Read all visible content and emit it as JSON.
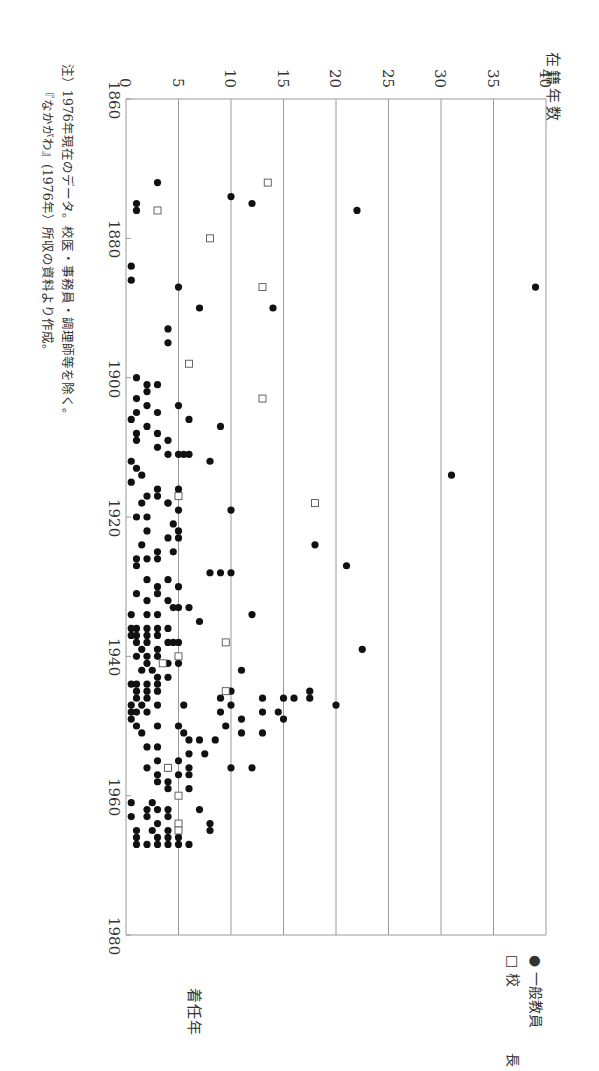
{
  "chart_data": {
    "type": "scatter",
    "orientation": "rotated-90-clockwise",
    "title": "",
    "xlabel": "着任年",
    "ylabel": "在籍年数",
    "xlim": [
      1860,
      1980
    ],
    "ylim": [
      0,
      40
    ],
    "x_ticks": [
      1860,
      1880,
      1900,
      1920,
      1940,
      1960,
      1980
    ],
    "y_ticks": [
      0,
      5,
      10,
      15,
      20,
      25,
      30,
      35,
      40
    ],
    "grid": "horizontal lines at each y tick",
    "legend": {
      "position": "lower-right (rotated)",
      "entries": [
        "一般教員",
        "校　長"
      ]
    },
    "series": [
      {
        "name": "一般教員",
        "marker": "filled-circle",
        "points": [
          [
            1872,
            3
          ],
          [
            1874,
            10
          ],
          [
            1875,
            1
          ],
          [
            1875,
            12
          ],
          [
            1876,
            1
          ],
          [
            1876,
            22
          ],
          [
            1884,
            0.5
          ],
          [
            1886,
            0.5
          ],
          [
            1887,
            39
          ],
          [
            1887,
            5
          ],
          [
            1890,
            7
          ],
          [
            1890,
            14
          ],
          [
            1893,
            4
          ],
          [
            1895,
            4
          ],
          [
            1900,
            1
          ],
          [
            1901,
            2
          ],
          [
            1901,
            3
          ],
          [
            1902,
            2
          ],
          [
            1903,
            1
          ],
          [
            1904,
            2
          ],
          [
            1904,
            5
          ],
          [
            1905,
            3
          ],
          [
            1905,
            1
          ],
          [
            1906,
            0.5
          ],
          [
            1906,
            6
          ],
          [
            1907,
            2
          ],
          [
            1907,
            9
          ],
          [
            1908,
            3
          ],
          [
            1908,
            1
          ],
          [
            1909,
            4
          ],
          [
            1909,
            1
          ],
          [
            1910,
            3
          ],
          [
            1911,
            5
          ],
          [
            1911,
            4
          ],
          [
            1911,
            6
          ],
          [
            1911,
            5.5
          ],
          [
            1912,
            0.5
          ],
          [
            1912,
            8
          ],
          [
            1913,
            1
          ],
          [
            1914,
            1.5
          ],
          [
            1914,
            31
          ],
          [
            1915,
            0.5
          ],
          [
            1916,
            3
          ],
          [
            1916,
            5
          ],
          [
            1917,
            2
          ],
          [
            1917,
            3
          ],
          [
            1918,
            4
          ],
          [
            1918,
            1.5
          ],
          [
            1918,
            4
          ],
          [
            1919,
            5
          ],
          [
            1919,
            10
          ],
          [
            1920,
            2
          ],
          [
            1920,
            1
          ],
          [
            1921,
            4.5
          ],
          [
            1922,
            2
          ],
          [
            1922,
            5
          ],
          [
            1923,
            4
          ],
          [
            1923,
            5
          ],
          [
            1924,
            1.5
          ],
          [
            1924,
            18
          ],
          [
            1925,
            3
          ],
          [
            1925,
            4.5
          ],
          [
            1926,
            2
          ],
          [
            1926,
            3
          ],
          [
            1926,
            1
          ],
          [
            1927,
            1
          ],
          [
            1927,
            21
          ],
          [
            1928,
            10
          ],
          [
            1928,
            9
          ],
          [
            1928,
            8
          ],
          [
            1929,
            2
          ],
          [
            1929,
            4
          ],
          [
            1930,
            3
          ],
          [
            1930,
            5
          ],
          [
            1931,
            1
          ],
          [
            1931,
            3
          ],
          [
            1932,
            2
          ],
          [
            1932,
            4
          ],
          [
            1933,
            4.5
          ],
          [
            1933,
            5
          ],
          [
            1933,
            6
          ],
          [
            1934,
            0.5
          ],
          [
            1934,
            2
          ],
          [
            1934,
            3
          ],
          [
            1934,
            12
          ],
          [
            1935,
            7
          ],
          [
            1936,
            0.5
          ],
          [
            1936,
            1
          ],
          [
            1936,
            2
          ],
          [
            1936,
            3
          ],
          [
            1936,
            4
          ],
          [
            1937,
            0.5
          ],
          [
            1937,
            1
          ],
          [
            1937,
            2
          ],
          [
            1937,
            3
          ],
          [
            1938,
            1
          ],
          [
            1938,
            2
          ],
          [
            1938,
            4
          ],
          [
            1938,
            4.5
          ],
          [
            1938,
            5
          ],
          [
            1939,
            1.5
          ],
          [
            1939,
            3
          ],
          [
            1939,
            22.5
          ],
          [
            1940,
            1
          ],
          [
            1940,
            2
          ],
          [
            1940,
            3
          ],
          [
            1941,
            2
          ],
          [
            1941,
            4
          ],
          [
            1941,
            5
          ],
          [
            1942,
            1.5
          ],
          [
            1942,
            2.5
          ],
          [
            1942,
            11
          ],
          [
            1943,
            3
          ],
          [
            1943,
            4
          ],
          [
            1944,
            0.5
          ],
          [
            1944,
            1
          ],
          [
            1944,
            2
          ],
          [
            1944,
            3
          ],
          [
            1945,
            1
          ],
          [
            1945,
            2
          ],
          [
            1945,
            3
          ],
          [
            1945,
            10
          ],
          [
            1945,
            17.5
          ],
          [
            1946,
            1
          ],
          [
            1946,
            2
          ],
          [
            1946,
            17.5
          ],
          [
            1946,
            9
          ],
          [
            1946,
            13
          ],
          [
            1946,
            15
          ],
          [
            1946,
            16
          ],
          [
            1947,
            0.5
          ],
          [
            1947,
            1.5
          ],
          [
            1947,
            3
          ],
          [
            1947,
            5.5
          ],
          [
            1947,
            10
          ],
          [
            1947,
            20
          ],
          [
            1948,
            0.5
          ],
          [
            1948,
            1
          ],
          [
            1948,
            2
          ],
          [
            1948,
            9
          ],
          [
            1948,
            13
          ],
          [
            1948,
            14.5
          ],
          [
            1949,
            0.5
          ],
          [
            1949,
            11
          ],
          [
            1949,
            15
          ],
          [
            1950,
            1
          ],
          [
            1950,
            3
          ],
          [
            1950,
            5
          ],
          [
            1950,
            9.5
          ],
          [
            1951,
            1.5
          ],
          [
            1951,
            5.5
          ],
          [
            1951,
            11
          ],
          [
            1951,
            13
          ],
          [
            1952,
            6
          ],
          [
            1952,
            7
          ],
          [
            1952,
            8.5
          ],
          [
            1953,
            2
          ],
          [
            1953,
            3
          ],
          [
            1954,
            6
          ],
          [
            1954,
            7.5
          ],
          [
            1955,
            3
          ],
          [
            1955,
            5
          ],
          [
            1956,
            2
          ],
          [
            1956,
            4
          ],
          [
            1956,
            6
          ],
          [
            1956,
            10
          ],
          [
            1956,
            12
          ],
          [
            1957,
            3
          ],
          [
            1957,
            5
          ],
          [
            1957,
            6
          ],
          [
            1958,
            3
          ],
          [
            1958,
            4
          ],
          [
            1959,
            4
          ],
          [
            1959,
            6
          ],
          [
            1961,
            0.5
          ],
          [
            1961,
            2.5
          ],
          [
            1962,
            2
          ],
          [
            1962,
            3
          ],
          [
            1962,
            4
          ],
          [
            1962,
            7
          ],
          [
            1963,
            0.5
          ],
          [
            1963,
            2
          ],
          [
            1963,
            4
          ],
          [
            1964,
            3
          ],
          [
            1964,
            5
          ],
          [
            1964,
            8
          ],
          [
            1965,
            1
          ],
          [
            1965,
            2.5
          ],
          [
            1965,
            4
          ],
          [
            1965,
            5
          ],
          [
            1965,
            8
          ],
          [
            1966,
            1
          ],
          [
            1966,
            3
          ],
          [
            1966,
            4
          ],
          [
            1966,
            5
          ],
          [
            1967,
            1
          ],
          [
            1967,
            2
          ],
          [
            1967,
            3
          ],
          [
            1967,
            4
          ],
          [
            1967,
            5
          ],
          [
            1967,
            6
          ]
        ]
      },
      {
        "name": "校　長",
        "marker": "hollow-square",
        "points": [
          [
            1872,
            13.5
          ],
          [
            1876,
            3
          ],
          [
            1880,
            8
          ],
          [
            1887,
            13
          ],
          [
            1898,
            6
          ],
          [
            1903,
            13
          ],
          [
            1917,
            5
          ],
          [
            1918,
            18
          ],
          [
            1938,
            9.5
          ],
          [
            1940,
            5
          ],
          [
            1941,
            3.5
          ],
          [
            1945,
            9.5
          ],
          [
            1956,
            4
          ],
          [
            1960,
            5
          ],
          [
            1964,
            5
          ],
          [
            1965,
            5
          ]
        ]
      }
    ]
  },
  "axes": {
    "y_axis_title": "在籍年数",
    "x_axis_title": "着任年",
    "x_tick_labels": [
      "1860",
      "1880",
      "1900",
      "1920",
      "1940",
      "1960",
      "1980"
    ],
    "y_tick_labels": [
      "0",
      "5",
      "10",
      "15",
      "20",
      "25",
      "30",
      "35",
      "40"
    ]
  },
  "legend": {
    "items": [
      {
        "label": "一般教員",
        "symbol": "●"
      },
      {
        "label": "校　長",
        "symbol": "□"
      }
    ]
  },
  "notes": {
    "line1": "注）1976年現在のデータ。校医・事務員・調理師等を除く。",
    "line2": "『なかがわ』(1976年）所収の資料より作成。"
  },
  "colors": {
    "gridline": "#9a9a9a",
    "marker": "#111111",
    "text": "#333333"
  }
}
